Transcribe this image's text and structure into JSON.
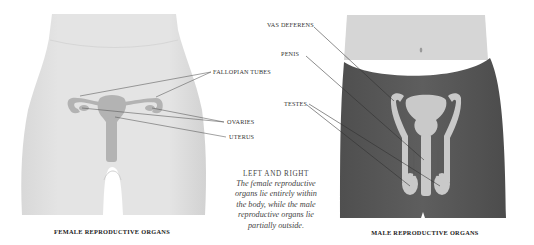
{
  "female_figure": {
    "caption": "FEMALE REPRODUCTIVE ORGANS",
    "labels": {
      "fallopian_tubes": "FALLOPIAN TUBES",
      "ovaries": "OVARIES",
      "uterus": "UTERUS"
    },
    "colors": {
      "body": "#e2e2e2",
      "organs": "#b3b3b3",
      "leader_line": "#555555"
    }
  },
  "male_figure": {
    "caption": "MALE REPRODUCTIVE ORGANS",
    "labels": {
      "vas_deferens": "VAS DEFERENS",
      "penis": "PENIS",
      "testes": "TESTES"
    },
    "colors": {
      "skin": "#d6d6d6",
      "trunks": "#5b5b5b",
      "organs": "#c9c9c9",
      "leader_line": "#2e2e2e"
    }
  },
  "note": {
    "heading": "LEFT AND RIGHT",
    "body": "The female reproductive organs lie entirely within the body, while the male reproductive organs lie partially outside."
  }
}
